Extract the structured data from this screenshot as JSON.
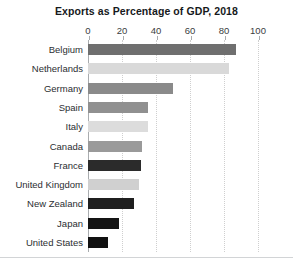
{
  "chart_data": {
    "type": "bar",
    "orientation": "horizontal",
    "title": "Exports as Percentage of GDP, 2018",
    "xlabel": "",
    "ylabel": "",
    "xlim": [
      0,
      100
    ],
    "xticks": [
      0,
      20,
      40,
      60,
      80,
      100
    ],
    "xtick_labels": [
      "0",
      "20",
      "40",
      "60",
      "80",
      "100"
    ],
    "grid": true,
    "legend": "none",
    "categories": [
      "Belgium",
      "Netherlands",
      "Germany",
      "Spain",
      "Italy",
      "Canada",
      "France",
      "United Kingdom",
      "New Zealand",
      "Japan",
      "United States"
    ],
    "values": [
      87,
      83,
      50,
      35,
      35,
      32,
      31,
      30,
      27,
      18,
      12
    ],
    "bar_colors": [
      "#6f6f6f",
      "#d9d9d9",
      "#8a8a8a",
      "#909090",
      "#dcdcdc",
      "#9a9a9a",
      "#2b2b2b",
      "#d0d0d0",
      "#1f1f1f",
      "#141414",
      "#111111"
    ]
  },
  "style": {
    "background": "#ffffff",
    "title_color": "#16191c",
    "label_color": "#2b2e31",
    "tick_color": "#3a3d41",
    "axis_color": "#a9acaf",
    "grid_color": "#cfcfcf",
    "footer_rule_color": "#d2d4d6"
  }
}
